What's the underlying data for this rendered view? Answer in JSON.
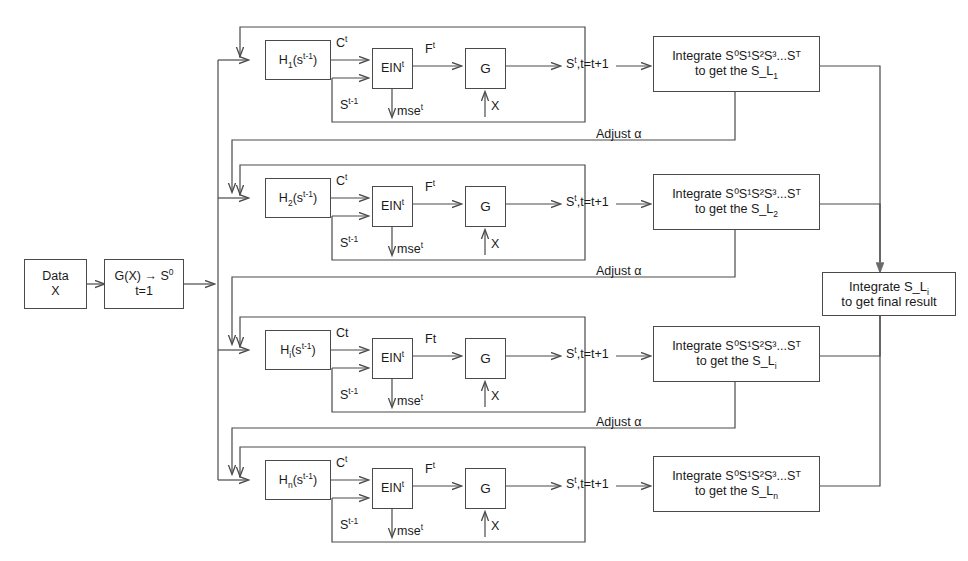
{
  "diagram": {
    "line_color": "#4a4a4a",
    "text_color": "#1a1a1a",
    "input": {
      "line1": "Data",
      "line2": "X"
    },
    "init": {
      "line1_a": "G(X)",
      "line1_arrow": "→",
      "line1_b": "S",
      "line1_b_sup": "0",
      "line2": "t=1"
    },
    "final": {
      "line1_a": "Integrate  S_L",
      "line1_sub": "i",
      "line2": "to get final result"
    },
    "adjust_label": "Adjust α",
    "rows": [
      {
        "id": "row-1",
        "h_base": "H",
        "h_sub": "1",
        "h_arg_a": "(s",
        "h_arg_sup": "t-1",
        "h_arg_b": ")",
        "c_label_base": "C",
        "c_label_sup": "t",
        "ein_base": "EIN",
        "ein_sup": "t",
        "f_label_base": "F",
        "f_label_sup": "t",
        "g_label": "G",
        "s_prev_base": "S",
        "s_prev_sup": "t-1",
        "mse_base": "mse",
        "mse_sup": "t",
        "x_label": "X",
        "out_base": "S",
        "out_sup": "t",
        "out_rest": ",t=t+1",
        "integrate_line1": "Integrate S⁰S¹S²S³...Sᵀ",
        "integrate_line2_a": "to get the S_L",
        "integrate_line2_sub": "1"
      },
      {
        "id": "row-2",
        "h_base": "H",
        "h_sub": "2",
        "h_arg_a": "(s",
        "h_arg_sup": "t-1",
        "h_arg_b": ")",
        "c_label_base": "C",
        "c_label_sup": "t",
        "ein_base": "EIN",
        "ein_sup": "t",
        "f_label_base": "F",
        "f_label_sup": "t",
        "g_label": "G",
        "s_prev_base": "S",
        "s_prev_sup": "t-1",
        "mse_base": "mse",
        "mse_sup": "t",
        "x_label": "X",
        "out_base": "S",
        "out_sup": "t",
        "out_rest": ",t=t+1",
        "integrate_line1": "Integrate S⁰S¹S²S³...Sᵀ",
        "integrate_line2_a": "to get the S_L",
        "integrate_line2_sub": "2"
      },
      {
        "id": "row-3",
        "h_base": "H",
        "h_sub": "i",
        "h_arg_a": "(s",
        "h_arg_sup": "t-1",
        "h_arg_b": ")",
        "c_label_base": "Ct",
        "c_label_sup": "",
        "ein_base": "EIN",
        "ein_sup": "t",
        "f_label_base": "Ft",
        "f_label_sup": "",
        "g_label": "G",
        "s_prev_base": "S",
        "s_prev_sup": "t-1",
        "mse_base": "mse",
        "mse_sup": "t",
        "x_label": "X",
        "out_base": "S",
        "out_sup": "t",
        "out_rest": ",t=t+1",
        "integrate_line1": "Integrate S⁰S¹S²S³...Sᵀ",
        "integrate_line2_a": "to get the S_L",
        "integrate_line2_sub": "i"
      },
      {
        "id": "row-4",
        "h_base": "H",
        "h_sub": "n",
        "h_arg_a": "(s",
        "h_arg_sup": "t-1",
        "h_arg_b": ")",
        "c_label_base": "C",
        "c_label_sup": "t",
        "ein_base": "EIN",
        "ein_sup": "t",
        "f_label_base": "F",
        "f_label_sup": "t",
        "g_label": "G",
        "s_prev_base": "S",
        "s_prev_sup": "t-1",
        "mse_base": "mse",
        "mse_sup": "t",
        "x_label": "X",
        "out_base": "S",
        "out_sup": "t",
        "out_rest": ",t=t+1",
        "integrate_line1": "Integrate S⁰S¹S²S³...Sᵀ",
        "integrate_line2_a": "to get the S_L",
        "integrate_line2_sub": "n"
      }
    ]
  }
}
